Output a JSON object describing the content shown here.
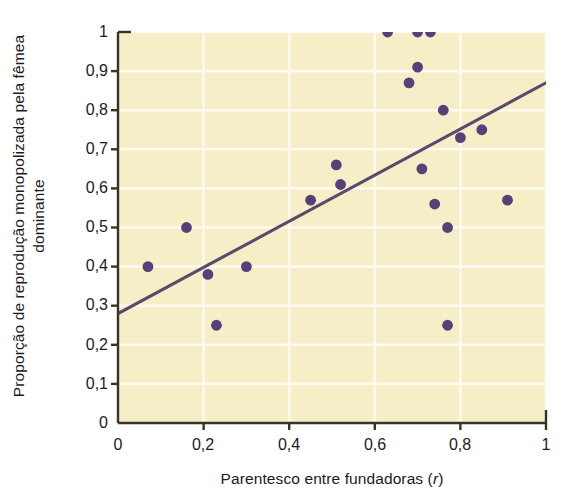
{
  "figure": {
    "background_color": "#ffffff",
    "plot_background_color": "#f6eec6",
    "gridline_color": "#fdfaf0",
    "axis_color": "#3b3226",
    "marker_color": "#55417a",
    "trendline_color": "#5a4a6e"
  },
  "chart_data": {
    "type": "scatter",
    "title": "",
    "xlabel": "Parentesco entre fundadoras (r)",
    "xlabel_main": "Parentesco entre fundadoras (",
    "xlabel_italic": "r",
    "xlabel_end": ")",
    "ylabel": "Proporção de reprodução monopolizada pela fêmea dominante",
    "xlim": [
      0,
      1
    ],
    "ylim": [
      0,
      1
    ],
    "grid": true,
    "legend": "none",
    "xticks": [
      0,
      0.2,
      0.4,
      0.6,
      0.8,
      1
    ],
    "xticklabels": [
      "0",
      "0,2",
      "0,4",
      "0,6",
      "0,8",
      "1"
    ],
    "yticks": [
      0,
      0.1,
      0.2,
      0.3,
      0.4,
      0.5,
      0.6,
      0.7,
      0.8,
      0.9,
      1
    ],
    "yticklabels": [
      "0",
      "0,1",
      "0,2",
      "0,3",
      "0,4",
      "0,5",
      "0,6",
      "0,7",
      "0,8",
      "0,9",
      "1"
    ],
    "x": [
      0.07,
      0.16,
      0.21,
      0.23,
      0.3,
      0.45,
      0.51,
      0.52,
      0.63,
      0.68,
      0.7,
      0.7,
      0.71,
      0.73,
      0.74,
      0.76,
      0.77,
      0.77,
      0.8,
      0.85,
      0.91
    ],
    "y": [
      0.4,
      0.5,
      0.38,
      0.25,
      0.4,
      0.57,
      0.66,
      0.61,
      1.0,
      0.87,
      1.0,
      0.91,
      0.65,
      1.0,
      0.56,
      0.8,
      0.5,
      0.25,
      0.73,
      0.75,
      0.57
    ],
    "points": [
      {
        "x": 0.07,
        "y": 0.4
      },
      {
        "x": 0.16,
        "y": 0.5
      },
      {
        "x": 0.21,
        "y": 0.38
      },
      {
        "x": 0.23,
        "y": 0.25
      },
      {
        "x": 0.3,
        "y": 0.4
      },
      {
        "x": 0.45,
        "y": 0.57
      },
      {
        "x": 0.51,
        "y": 0.66
      },
      {
        "x": 0.52,
        "y": 0.61
      },
      {
        "x": 0.63,
        "y": 1.0
      },
      {
        "x": 0.68,
        "y": 0.87
      },
      {
        "x": 0.7,
        "y": 1.0
      },
      {
        "x": 0.7,
        "y": 0.91
      },
      {
        "x": 0.71,
        "y": 0.65
      },
      {
        "x": 0.73,
        "y": 1.0
      },
      {
        "x": 0.74,
        "y": 0.56
      },
      {
        "x": 0.76,
        "y": 0.8
      },
      {
        "x": 0.77,
        "y": 0.5
      },
      {
        "x": 0.77,
        "y": 0.25
      },
      {
        "x": 0.8,
        "y": 0.73
      },
      {
        "x": 0.85,
        "y": 0.75
      },
      {
        "x": 0.91,
        "y": 0.57
      }
    ],
    "trendline": {
      "x0": 0,
      "y0": 0.28,
      "x1": 1,
      "y1": 0.87
    }
  }
}
